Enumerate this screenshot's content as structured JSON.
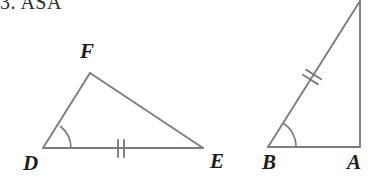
{
  "heading": {
    "text": "3. ASA",
    "note": "top of text clipped by image edge"
  },
  "colors": {
    "stroke": "#7d7d7d",
    "label": "#1c1c1c",
    "heading": "#2b2b2b",
    "background": "#ffffff"
  },
  "figures": [
    {
      "name": "triangle-def",
      "vertices": [
        {
          "id": "D",
          "label": "D",
          "x": 43,
          "y": 148,
          "label_x": 23,
          "label_y": 170
        },
        {
          "id": "E",
          "label": "E",
          "x": 203,
          "y": 148,
          "label_x": 210,
          "label_y": 168
        },
        {
          "id": "F",
          "label": "F",
          "x": 90,
          "y": 73,
          "label_x": 80,
          "label_y": 58
        }
      ],
      "marks": {
        "angle_at": "D",
        "tick_segment": "DE",
        "tick_count": 2
      }
    },
    {
      "name": "triangle-abc",
      "vertices": [
        {
          "id": "B",
          "label": "B",
          "x": 268,
          "y": 147,
          "label_x": 264,
          "label_y": 169
        },
        {
          "id": "A",
          "label": "A",
          "x": 360,
          "y": 147,
          "label_x": 348,
          "label_y": 169
        },
        {
          "id": "C",
          "label": "",
          "x": 360,
          "y": 1,
          "label_x": 0,
          "label_y": 0
        }
      ],
      "marks": {
        "angle_at": "B",
        "tick_segment": "BC",
        "tick_count": 2
      }
    }
  ]
}
